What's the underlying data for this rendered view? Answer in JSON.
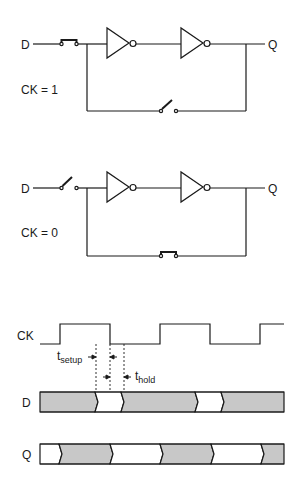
{
  "circuit_top": {
    "input_label": "D",
    "output_label": "Q",
    "clock_state": "CK = 1",
    "input_switch": "closed",
    "feedback_switch": "open"
  },
  "circuit_bottom": {
    "input_label": "D",
    "output_label": "Q",
    "clock_state": "CK = 0",
    "input_switch": "open",
    "feedback_switch": "closed"
  },
  "timing": {
    "clock_label": "CK",
    "data_label": "D",
    "output_label": "Q",
    "setup_label": "t",
    "setup_sub": "setup",
    "hold_label": "t",
    "hold_sub": "hold"
  },
  "colors": {
    "line": "#1a1a1a",
    "band_fill": "#c8c8c8"
  }
}
